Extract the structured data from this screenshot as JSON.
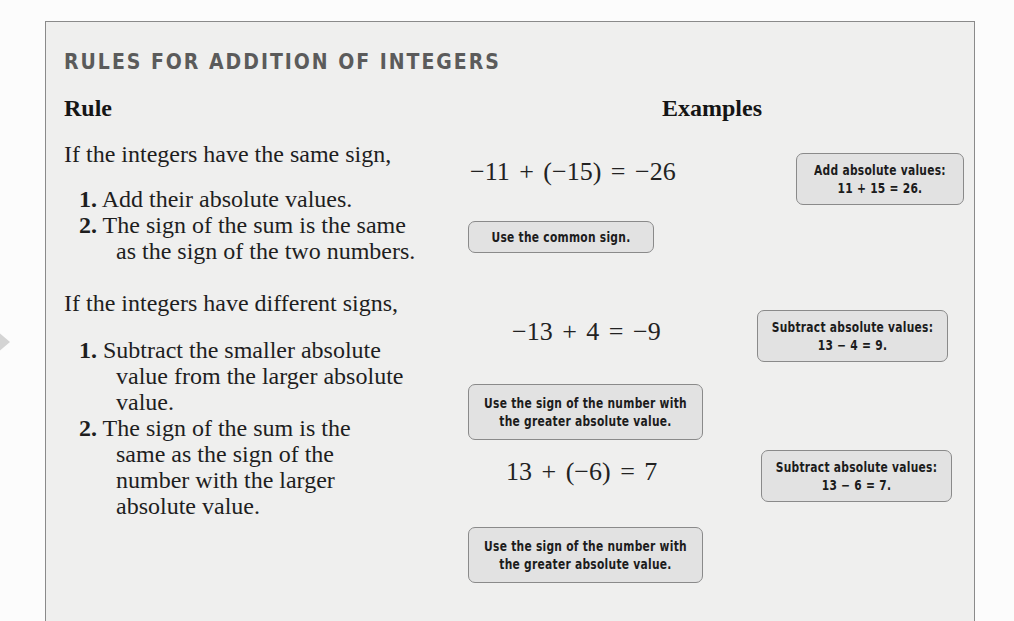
{
  "box": {
    "title": "RULES FOR ADDITION OF INTEGERS",
    "col_rule": "Rule",
    "col_examples": "Examples"
  },
  "same_sign": {
    "intro": "If the integers have the same sign,",
    "steps": [
      {
        "num": "1.",
        "lines": [
          "Add their absolute values."
        ]
      },
      {
        "num": "2.",
        "lines": [
          "The sign of the sum is the same",
          "as the sign of the two numbers."
        ]
      }
    ],
    "example": {
      "equation": "−11 + (−15) = −26",
      "callout_right": [
        "Add absolute values:",
        "11 + 15 = 26."
      ],
      "callout_below": [
        "Use the common sign."
      ]
    }
  },
  "different_signs": {
    "intro": "If the integers have different signs,",
    "steps": [
      {
        "num": "1.",
        "lines": [
          "Subtract the smaller absolute",
          "value from the larger absolute",
          "value."
        ]
      },
      {
        "num": "2.",
        "lines": [
          "The sign of the sum is the",
          "same as the sign of the",
          "number with the larger",
          "absolute value."
        ]
      }
    ],
    "examples": [
      {
        "equation": "−13 + 4 = −9",
        "callout_right": [
          "Subtract absolute values:",
          "13 − 4 = 9."
        ],
        "callout_below": [
          "Use the sign of the number with",
          "the greater absolute value."
        ]
      },
      {
        "equation": "13 + (−6) = 7",
        "callout_right": [
          "Subtract absolute values:",
          "13 − 6 = 7."
        ],
        "callout_below": [
          "Use the sign of the number with",
          "the greater absolute value."
        ]
      }
    ]
  },
  "colors": {
    "box_bg": "#efefee",
    "box_border": "#8a8a8a",
    "title": "#5b5b5b",
    "callout_bg": "#e2e2e2"
  }
}
